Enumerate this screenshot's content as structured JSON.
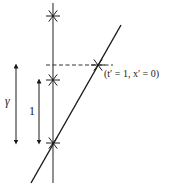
{
  "diagram": {
    "type": "spacetime-diagram",
    "colors": {
      "stroke": "#1a1a1a",
      "worldline": "#555555",
      "background": "#ffffff"
    },
    "vertical_worldline": {
      "x": 53,
      "y_top": 3,
      "y_bottom": 183
    },
    "diagonal_worldline": {
      "x1": 31,
      "y1": 183,
      "x2": 121,
      "y2": 25
    },
    "dashed_line": {
      "x1": 46,
      "x2": 113,
      "y": 65
    },
    "events": [
      {
        "name": "event-top",
        "x": 53,
        "y": 16
      },
      {
        "name": "event-middle",
        "x": 53,
        "y": 80
      },
      {
        "name": "event-origin",
        "x": 53,
        "y": 143
      },
      {
        "name": "event-t-prime-1",
        "x": 98,
        "y": 65
      }
    ],
    "arrows": [
      {
        "name": "gamma-interval-arrow",
        "x": 16,
        "y_top": 65,
        "y_bottom": 143
      },
      {
        "name": "unit-interval-arrow",
        "x": 39,
        "y_top": 80,
        "y_bottom": 143
      }
    ],
    "labels": {
      "gamma": "γ",
      "unit": "1",
      "event_coords": "(t′ = 1, x′ = 0)"
    }
  }
}
